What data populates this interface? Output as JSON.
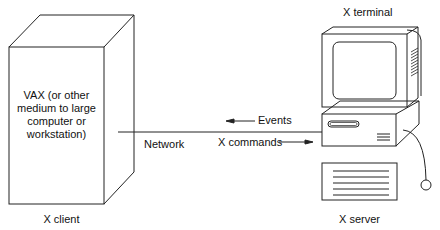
{
  "diagram": {
    "client": {
      "box_text_lines": [
        "VAX (or other",
        "medium to large",
        "computer or",
        "workstation)"
      ],
      "caption": "X client"
    },
    "server": {
      "top_caption": "X terminal",
      "caption": "X server"
    },
    "network": {
      "label": "Network",
      "events_label": "Events",
      "commands_label": "X commands"
    }
  }
}
